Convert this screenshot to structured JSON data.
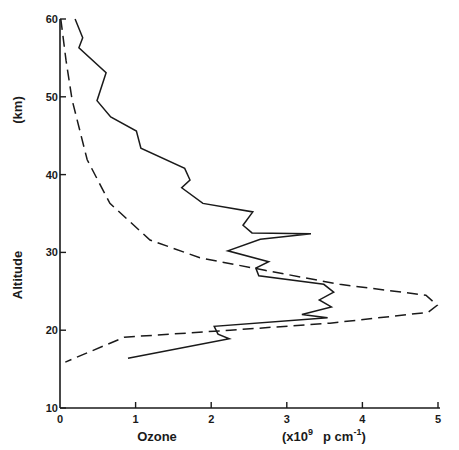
{
  "chart_data": {
    "type": "line",
    "title": "",
    "xlabel": "Ozone",
    "xlabel_units": "(x10^9 p cm^-1)",
    "ylabel": "Altitude",
    "ylabel_units": "(km)",
    "xlim": [
      0,
      5
    ],
    "ylim": [
      10,
      60
    ],
    "x_ticks": [
      0,
      1,
      2,
      3,
      4,
      5
    ],
    "y_ticks": [
      10,
      20,
      30,
      40,
      50,
      60
    ],
    "grid": false,
    "legend": null,
    "series": [
      {
        "name": "measured profile",
        "style": "solid",
        "points": [
          [
            0.2,
            60.0
          ],
          [
            0.3,
            57.6
          ],
          [
            0.25,
            56.3
          ],
          [
            0.61,
            53.1
          ],
          [
            0.49,
            49.5
          ],
          [
            0.67,
            47.4
          ],
          [
            1.01,
            45.6
          ],
          [
            1.07,
            43.4
          ],
          [
            1.65,
            40.8
          ],
          [
            1.72,
            39.3
          ],
          [
            1.61,
            38.3
          ],
          [
            1.89,
            36.3
          ],
          [
            2.55,
            35.2
          ],
          [
            2.42,
            33.5
          ],
          [
            2.54,
            32.5
          ],
          [
            3.32,
            32.4
          ],
          [
            2.65,
            31.7
          ],
          [
            2.22,
            30.2
          ],
          [
            2.76,
            28.8
          ],
          [
            2.59,
            28.0
          ],
          [
            2.63,
            27.0
          ],
          [
            3.49,
            25.9
          ],
          [
            3.62,
            24.9
          ],
          [
            3.43,
            23.9
          ],
          [
            3.59,
            23.0
          ],
          [
            3.2,
            22.0
          ],
          [
            3.54,
            21.6
          ],
          [
            2.04,
            20.5
          ],
          [
            2.09,
            19.5
          ],
          [
            2.24,
            18.9
          ],
          [
            0.9,
            16.4
          ]
        ]
      },
      {
        "name": "model profile",
        "style": "dashed",
        "points": [
          [
            0.01,
            60.0
          ],
          [
            0.08,
            54.7
          ],
          [
            0.16,
            49.6
          ],
          [
            0.36,
            41.9
          ],
          [
            0.66,
            36.3
          ],
          [
            1.19,
            31.6
          ],
          [
            1.85,
            29.3
          ],
          [
            2.71,
            27.7
          ],
          [
            3.7,
            25.9
          ],
          [
            4.84,
            24.5
          ],
          [
            4.99,
            23.2
          ],
          [
            4.87,
            22.3
          ],
          [
            3.57,
            20.9
          ],
          [
            2.25,
            20.0
          ],
          [
            0.85,
            19.1
          ],
          [
            0.07,
            15.9
          ]
        ]
      }
    ]
  },
  "axes": {
    "x_title": "Ozone",
    "x_units_prefix": "(x10",
    "x_units_exp": "9",
    "x_units_mid": "p cm",
    "x_units_exp2": "-1",
    "x_units_suffix": ")",
    "y_title": "Altitude",
    "y_units": "(km)"
  },
  "colors": {
    "ink": "#1a1a1a",
    "background": "#ffffff"
  }
}
